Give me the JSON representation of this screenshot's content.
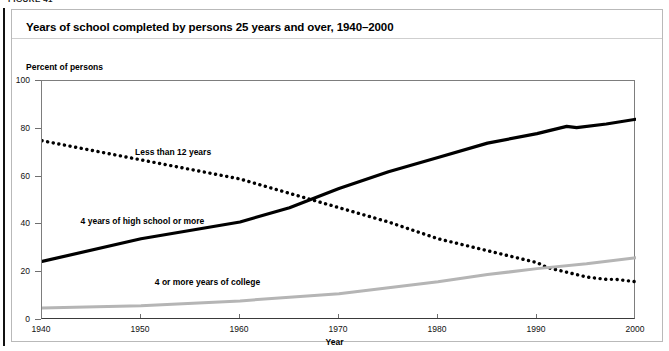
{
  "figure": {
    "label": "FIGURE 41"
  },
  "title": "Years of school completed by persons 25 years and over, 1940–2000",
  "axis_note": "Percent of persons",
  "chart_data": {
    "type": "line",
    "title": "Years of school completed by persons 25 years and over, 1940–2000",
    "xlabel": "Year",
    "ylabel": "Percent of persons",
    "xlim": [
      1940,
      2000
    ],
    "ylim": [
      0,
      100
    ],
    "grid": false,
    "legend": "inline-labels",
    "xticks": [
      1940,
      1950,
      1960,
      1970,
      1980,
      1990,
      2000
    ],
    "yticks": [
      0,
      20,
      40,
      60,
      80,
      100
    ],
    "series": [
      {
        "name": "Less than 12 years",
        "style": "dotted",
        "color": "#000000",
        "x": [
          1940,
          1945,
          1950,
          1955,
          1960,
          1965,
          1970,
          1975,
          1980,
          1985,
          1990,
          1991,
          1993,
          1995,
          1997,
          1998,
          2000
        ],
        "values": [
          75,
          71,
          67,
          63,
          59,
          53,
          47,
          41,
          34,
          29,
          24,
          22,
          20,
          18,
          17,
          17,
          16
        ]
      },
      {
        "name": "4 years of high school or more",
        "style": "solid",
        "color": "#000000",
        "x": [
          1940,
          1950,
          1960,
          1965,
          1970,
          1975,
          1980,
          1985,
          1990,
          1993,
          1994,
          1997,
          2000
        ],
        "values": [
          24.5,
          34,
          41,
          47,
          55,
          62,
          68,
          74,
          78,
          81,
          80.5,
          82,
          84
        ]
      },
      {
        "name": "4 or more years of college",
        "style": "solid",
        "color": "#b5b5b5",
        "x": [
          1940,
          1950,
          1960,
          1965,
          1970,
          1975,
          1980,
          1985,
          1990,
          1995,
          2000
        ],
        "values": [
          5,
          6,
          8,
          9.5,
          11,
          13.5,
          16,
          19,
          21.5,
          23.5,
          26
        ]
      }
    ],
    "annotations": [
      {
        "text": "Less than 12 years",
        "x": 1949.5,
        "y": 70
      },
      {
        "text": "4 years of high school or more",
        "x": 1944,
        "y": 41
      },
      {
        "text": "4 or more years of college",
        "x": 1951.5,
        "y": 15.5
      }
    ]
  },
  "colors": {
    "line_dark": "#000000",
    "line_gray": "#b5b5b5",
    "axis": "#6f6f6f",
    "frame": "#b9b9b9"
  }
}
